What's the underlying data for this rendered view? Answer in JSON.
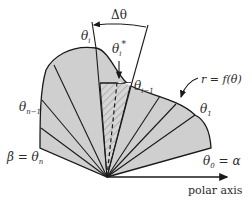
{
  "figure": {
    "colors": {
      "region_fill": "#cfcfcf",
      "stroke": "#1a1a1a",
      "background": "#ffffff"
    },
    "labels": {
      "delta_theta": "Δθ",
      "theta_i": "θ",
      "theta_i_sub": "i",
      "theta_i_star": "θ",
      "theta_i_star_sub": "i",
      "theta_i_star_sup": "*",
      "theta_i_minus_1": "θ",
      "theta_i_minus_1_sub": "i−1",
      "curve_equation": "r = f(θ)",
      "theta_1": "θ",
      "theta_1_sub": "1",
      "theta_n_minus_1": "θ",
      "theta_n_minus_1_sub": "n−1",
      "beta_eq": "β = θ",
      "beta_sub": "n",
      "theta_0": "θ",
      "theta_0_sub": "0",
      "theta_0_eq": " = α",
      "polar_axis": "polar axis"
    }
  }
}
